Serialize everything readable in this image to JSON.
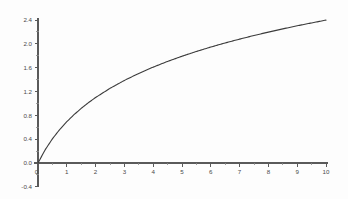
{
  "chart_data": {
    "type": "line",
    "title": "",
    "subtitle": "",
    "xlabel": "",
    "ylabel": "",
    "xlim": [
      -0.35,
      10.6
    ],
    "ylim": [
      -0.4,
      2.4
    ],
    "grid": false,
    "legend": null,
    "legend_position": "none",
    "background_color": "#fdfdfd",
    "axis_color": "#5a5a5a",
    "curve_color": "#3c3c3c",
    "x_ticks": [
      0,
      1,
      2,
      3,
      4,
      5,
      6,
      7,
      8,
      9,
      10
    ],
    "x_tick_labels": [
      "0",
      "1",
      "2",
      "3",
      "4",
      "5",
      "6",
      "7",
      "8",
      "9",
      "10"
    ],
    "x_minor_step": 0.5,
    "y_ticks": [
      -0.4,
      0.0,
      0.4,
      0.8,
      1.2,
      1.6,
      2.0,
      2.4
    ],
    "y_tick_labels": [
      "-0.4",
      "0.0",
      "0.4",
      "0.8",
      "1.2",
      "1.6",
      "2.0",
      "2.4"
    ],
    "y_minor_step": 0.2,
    "series": [
      {
        "name": "ln(1+x)",
        "x": [
          0,
          0.25,
          0.5,
          0.75,
          1,
          1.25,
          1.5,
          1.75,
          2,
          2.5,
          3,
          3.5,
          4,
          4.5,
          5,
          5.5,
          6,
          6.5,
          7,
          7.5,
          8,
          8.5,
          9,
          9.5,
          10
        ],
        "values": [
          0,
          0.223,
          0.405,
          0.56,
          0.693,
          0.811,
          0.916,
          1.012,
          1.099,
          1.253,
          1.386,
          1.504,
          1.609,
          1.705,
          1.792,
          1.872,
          1.946,
          2.015,
          2.079,
          2.14,
          2.197,
          2.251,
          2.303,
          2.351,
          2.398
        ]
      }
    ],
    "annotations": []
  }
}
